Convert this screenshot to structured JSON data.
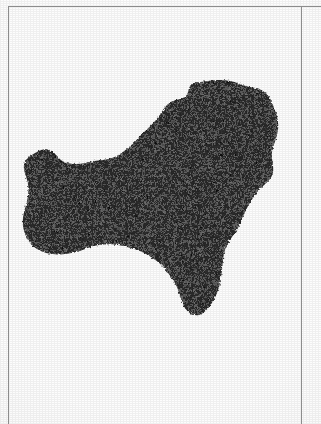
{
  "document": {
    "type": "scanned-page",
    "page_background": "#fdfdfd",
    "rule_color": "#8c8c8c",
    "description": "Scanned book page showing a solid black island silhouette with thin ruled frame lines"
  },
  "frame": {
    "top_rule": {
      "x": 8,
      "y": 6,
      "width": 313,
      "orientation": "horizontal"
    },
    "left_rule": {
      "x": 8,
      "y": 6,
      "height": 418,
      "orientation": "vertical"
    },
    "right_rule": {
      "x": 301,
      "y": 6,
      "height": 418,
      "orientation": "vertical"
    }
  },
  "figure": {
    "name": "island-silhouette",
    "fill_color": "#0d0d0d",
    "texture": "dithered-halftone",
    "bounds": {
      "left": 22,
      "top": 80,
      "right": 279,
      "bottom": 316
    },
    "outline_path": "M 208 81 C 220 79 231 80 240 84 C 249 88 257 87 263 91 C 269 95 272 101 274 108 C 277 115 279 122 278 130 C 277 138 273 145 272 152 C 271 159 274 165 273 172 C 272 179 266 183 261 188 C 256 193 252 199 248 206 C 244 213 242 221 238 228 C 234 235 229 240 226 247 C 223 254 223 262 222 270 C 221 278 220 286 217 293 C 214 300 210 308 203 313 C 196 318 189 314 185 308 C 181 302 180 294 177 287 C 174 280 169 274 164 268 C 159 262 153 258 146 254 C 139 250 131 248 123 246 C 115 244 107 244 99 245 C 91 246 84 250 76 252 C 68 254 60 255 52 254 C 44 253 37 250 32 245 C 27 240 24 233 23 226 C 22 219 24 212 26 205 C 28 198 29 191 28 184 C 27 177 23 171 24 165 C 25 159 30 156 35 153 C 40 150 45 148 50 150 C 55 152 57 157 61 160 C 65 163 70 164 76 164 C 82 164 88 162 94 161 C 100 160 106 160 112 158 C 118 156 123 152 128 148 C 133 144 137 139 142 134 C 147 129 152 125 156 120 C 160 115 163 109 167 105 C 171 101 176 100 180 99 C 184 98 187 96 188 92 C 189 88 190 84 194 83 C 198 82 203 82 208 81 Z",
    "coast_features": [
      {
        "name": "north-bay",
        "position": "north-central concave bay"
      },
      {
        "name": "northwest-notch",
        "position": "small notch on northwest coast"
      },
      {
        "name": "west-peninsula",
        "position": "broad western lobe"
      },
      {
        "name": "south-point",
        "position": "southern pointed tip"
      },
      {
        "name": "east-coast",
        "position": "rounded eastern shoreline"
      }
    ]
  }
}
